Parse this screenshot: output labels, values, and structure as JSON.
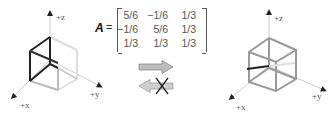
{
  "left_cube": {
    "axis_labels": {
      "z": "+z",
      "x": "+x",
      "y": "+y"
    }
  },
  "matrix": {
    "symbol": "A",
    "equals": "=",
    "rows": [
      [
        "5/6",
        "−1/6",
        "1/3"
      ],
      [
        "−1/6",
        "5/6",
        "1/3"
      ],
      [
        "1/3",
        "1/3",
        "1/3"
      ]
    ]
  },
  "arrows": {
    "forward": {
      "direction": "right",
      "crossed": false,
      "color": "#b8b8b8"
    },
    "backward": {
      "direction": "left",
      "crossed": true,
      "color": "#c8c8c8"
    }
  },
  "right_cube": {
    "axis_labels": {
      "z": "+z",
      "x": "+x",
      "y": "+y"
    }
  }
}
